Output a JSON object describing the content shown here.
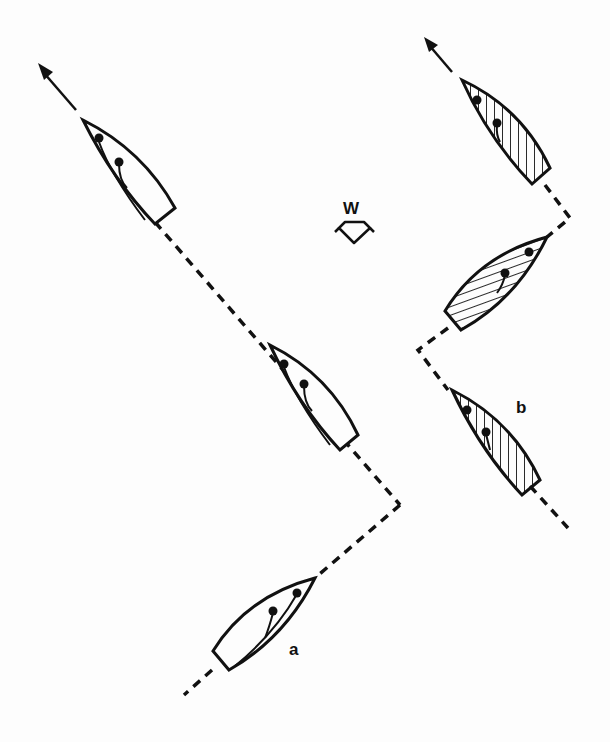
{
  "diagram": {
    "type": "sailing-tactics",
    "colors": {
      "ink": "#111111",
      "background": "#fdfdfd"
    },
    "wind": {
      "label": "W",
      "icon": "wind-direction-arrow-icon"
    },
    "boat_a": {
      "label": "a",
      "fill": "none",
      "positions": 3
    },
    "boat_b": {
      "label": "b",
      "fill": "hatched",
      "positions": 3
    }
  }
}
